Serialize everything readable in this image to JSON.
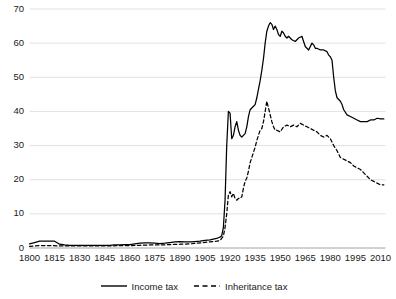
{
  "chart_data": {
    "type": "line",
    "title": "",
    "xlabel": "",
    "ylabel": "",
    "xlim": [
      1800,
      2013
    ],
    "ylim": [
      0,
      70
    ],
    "grid": true,
    "grid_axis": "y",
    "legend_position": "bottom-center",
    "xticks": [
      1800,
      1815,
      1830,
      1845,
      1860,
      1875,
      1890,
      1905,
      1920,
      1935,
      1950,
      1965,
      1980,
      1995,
      2010
    ],
    "yticks": [
      0,
      10,
      20,
      30,
      40,
      50,
      60,
      70
    ],
    "series": [
      {
        "name": "Income tax",
        "style": "solid",
        "color": "#000000",
        "x": [
          1800,
          1803,
          1806,
          1809,
          1812,
          1815,
          1818,
          1821,
          1824,
          1827,
          1830,
          1833,
          1836,
          1839,
          1842,
          1845,
          1848,
          1851,
          1854,
          1857,
          1860,
          1863,
          1866,
          1869,
          1872,
          1875,
          1878,
          1881,
          1884,
          1887,
          1890,
          1893,
          1896,
          1899,
          1902,
          1905,
          1908,
          1910,
          1912,
          1913,
          1914,
          1915,
          1916,
          1917,
          1918,
          1919,
          1920,
          1921,
          1922,
          1923,
          1924,
          1925,
          1926,
          1927,
          1928,
          1929,
          1930,
          1931,
          1932,
          1933,
          1934,
          1935,
          1936,
          1937,
          1938,
          1939,
          1940,
          1941,
          1942,
          1943,
          1944,
          1945,
          1946,
          1947,
          1948,
          1949,
          1950,
          1951,
          1952,
          1953,
          1954,
          1955,
          1957,
          1959,
          1961,
          1963,
          1964,
          1965,
          1967,
          1969,
          1970,
          1971,
          1972,
          1974,
          1976,
          1978,
          1979,
          1980,
          1981,
          1982,
          1983,
          1984,
          1985,
          1986,
          1987,
          1988,
          1990,
          1992,
          1994,
          1996,
          1998,
          2000,
          2002,
          2004,
          2006,
          2008,
          2010,
          2012
        ],
        "y": [
          1.2,
          1.6,
          2.0,
          2.0,
          2.0,
          2.0,
          1.1,
          0.9,
          0.8,
          0.8,
          0.8,
          0.8,
          0.8,
          0.8,
          0.8,
          0.8,
          0.8,
          0.9,
          0.9,
          1.0,
          1.0,
          1.2,
          1.4,
          1.5,
          1.5,
          1.4,
          1.3,
          1.4,
          1.6,
          1.8,
          1.9,
          1.8,
          1.8,
          1.9,
          2.0,
          2.2,
          2.4,
          2.6,
          2.8,
          3.0,
          3.2,
          3.6,
          6.0,
          14.0,
          30.0,
          40.0,
          39.5,
          32.0,
          33.0,
          35.5,
          37.0,
          34.5,
          33.0,
          32.5,
          33.0,
          33.5,
          35.5,
          38.5,
          40.5,
          41.0,
          41.5,
          42.0,
          44.0,
          46.5,
          49.0,
          52.0,
          55.5,
          60.0,
          63.5,
          65.0,
          66.0,
          65.5,
          64.0,
          65.0,
          64.0,
          62.5,
          62.0,
          63.5,
          63.0,
          62.0,
          61.5,
          62.0,
          61.0,
          60.5,
          61.5,
          62.0,
          60.5,
          59.0,
          58.0,
          60.0,
          59.5,
          58.5,
          58.5,
          58.0,
          58.0,
          57.5,
          56.5,
          56.0,
          55.0,
          50.0,
          46.0,
          44.0,
          43.5,
          43.0,
          42.0,
          40.5,
          39.0,
          38.5,
          38.0,
          37.5,
          37.0,
          37.0,
          37.0,
          37.5,
          37.5,
          38.0,
          37.8,
          37.8
        ]
      },
      {
        "name": "Inheritance tax",
        "style": "dashed",
        "color": "#000000",
        "x": [
          1800,
          1806,
          1812,
          1818,
          1824,
          1830,
          1836,
          1842,
          1848,
          1854,
          1860,
          1866,
          1872,
          1878,
          1884,
          1890,
          1896,
          1900,
          1904,
          1906,
          1908,
          1910,
          1912,
          1914,
          1916,
          1917,
          1918,
          1919,
          1920,
          1921,
          1922,
          1923,
          1924,
          1925,
          1926,
          1927,
          1928,
          1929,
          1930,
          1931,
          1932,
          1934,
          1935,
          1936,
          1937,
          1938,
          1939,
          1940,
          1941,
          1942,
          1943,
          1944,
          1945,
          1946,
          1947,
          1948,
          1950,
          1952,
          1954,
          1956,
          1958,
          1960,
          1962,
          1964,
          1966,
          1968,
          1970,
          1972,
          1974,
          1976,
          1978,
          1980,
          1982,
          1984,
          1985,
          1986,
          1988,
          1990,
          1992,
          1994,
          1996,
          1998,
          2000,
          2002,
          2004,
          2006,
          2008,
          2010,
          2012
        ],
        "y": [
          0.5,
          0.7,
          0.7,
          0.6,
          0.6,
          0.6,
          0.6,
          0.6,
          0.6,
          0.7,
          0.7,
          0.8,
          0.9,
          0.9,
          1.0,
          1.1,
          1.2,
          1.4,
          1.6,
          1.7,
          1.8,
          1.9,
          2.0,
          2.2,
          3.5,
          6.0,
          10.0,
          15.5,
          16.5,
          15.0,
          16.0,
          14.5,
          14.0,
          14.5,
          14.5,
          15.0,
          17.5,
          19.5,
          20.5,
          22.5,
          25.0,
          28.0,
          29.5,
          31.5,
          33.0,
          34.5,
          35.0,
          37.0,
          40.0,
          43.0,
          41.0,
          39.0,
          37.0,
          35.5,
          34.5,
          34.5,
          34.0,
          35.5,
          36.0,
          35.5,
          36.0,
          35.5,
          36.5,
          36.0,
          35.5,
          35.0,
          34.5,
          34.0,
          33.0,
          32.5,
          33.0,
          32.0,
          30.0,
          28.5,
          27.5,
          26.5,
          26.0,
          25.5,
          25.0,
          24.0,
          23.5,
          23.0,
          22.0,
          21.0,
          20.0,
          19.5,
          19.0,
          18.5,
          18.5
        ]
      }
    ]
  },
  "legend": {
    "items": [
      {
        "label": "Income tax",
        "style": "solid"
      },
      {
        "label": "Inheritance tax",
        "style": "dashed"
      }
    ]
  }
}
